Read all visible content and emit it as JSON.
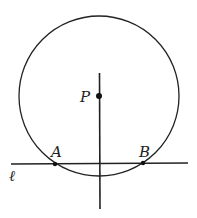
{
  "diagram": {
    "circle": {
      "cx": 99,
      "cy": 96,
      "r": 80
    },
    "line_l": {
      "x1": 11,
      "y1": 164,
      "x2": 188,
      "y2": 163
    },
    "perpendicular": {
      "x1": 99,
      "y1": 73,
      "x2": 100,
      "y2": 209
    },
    "points": [
      {
        "label": "P",
        "x": 99,
        "y": 96
      },
      {
        "label": "A",
        "x": 55,
        "y": 164
      },
      {
        "label": "B",
        "x": 143,
        "y": 163
      }
    ],
    "labels": {
      "P": "P",
      "A": "A",
      "B": "B",
      "line": "ℓ"
    },
    "stroke_color": "#222222"
  }
}
